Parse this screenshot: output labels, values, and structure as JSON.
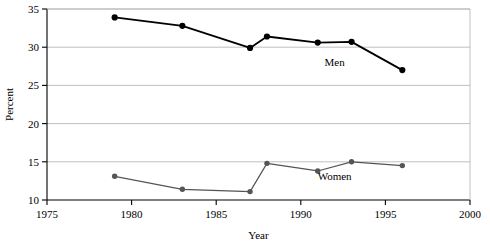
{
  "chart_data": {
    "type": "line",
    "title": "",
    "subtitle": "",
    "xlabel": "Year",
    "ylabel": "Percent",
    "xlim": [
      1975,
      2000
    ],
    "ylim": [
      10,
      35
    ],
    "xticks": [
      1975,
      1980,
      1985,
      1990,
      1995,
      2000
    ],
    "xtick_labels": [
      "1975",
      "1980",
      "1985",
      "1990",
      "1995",
      "2000"
    ],
    "yticks": [
      10,
      15,
      20,
      25,
      30,
      35
    ],
    "ytick_labels": [
      "10",
      "15",
      "20",
      "25",
      "30",
      "35"
    ],
    "grid": "horizontal",
    "legend_position": "inline-annotation",
    "series": [
      {
        "name": "Men",
        "color": "#000000",
        "marker": "filled-circle",
        "line_width": 1.8,
        "x": [
          1979,
          1983,
          1987,
          1988,
          1991,
          1993,
          1996
        ],
        "values": [
          33.9,
          32.8,
          29.9,
          31.4,
          30.6,
          30.7,
          27.0
        ],
        "label": "Men",
        "label_x": 1992,
        "label_y": 27.5
      },
      {
        "name": "Women",
        "color": "#555555",
        "marker": "filled-circle",
        "line_width": 1.2,
        "x": [
          1979,
          1983,
          1987,
          1988,
          1991,
          1993,
          1996
        ],
        "values": [
          13.1,
          11.4,
          11.1,
          14.8,
          13.8,
          15.0,
          14.5
        ],
        "label": "Women",
        "label_x": 1992,
        "label_y": 12.6
      }
    ],
    "annotations": [],
    "colors": {
      "axis": "#000000",
      "grid": "#b0b0b0",
      "men": "#000000",
      "women": "#555555",
      "background": "#ffffff"
    }
  }
}
